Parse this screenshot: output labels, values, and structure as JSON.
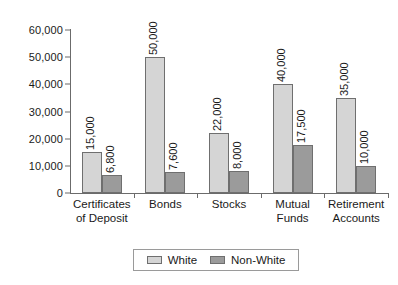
{
  "chart_data": {
    "type": "bar",
    "title": "",
    "xlabel": "",
    "ylabel": "",
    "ylim": [
      0,
      60000
    ],
    "grid": false,
    "legend_position": "bottom",
    "categories": [
      "Certificates of Deposit",
      "Bonds",
      "Stocks",
      "Mutual Funds",
      "Retirement Accounts"
    ],
    "category_lines": [
      [
        "Certificates",
        "of Deposit"
      ],
      [
        "Bonds",
        ""
      ],
      [
        "Stocks",
        ""
      ],
      [
        "Mutual",
        "Funds"
      ],
      [
        "Retirement",
        "Accounts"
      ]
    ],
    "series": [
      {
        "name": "White",
        "color": "#d5d5d5",
        "values": [
          15000,
          50000,
          22000,
          40000,
          35000
        ],
        "labels": [
          "15,000",
          "50,000",
          "22,000",
          "40,000",
          "35,000"
        ]
      },
      {
        "name": "Non-White",
        "color": "#9b9b9b",
        "values": [
          6800,
          7600,
          8000,
          17500,
          10000
        ],
        "labels": [
          "6,800",
          "7,600",
          "8,000",
          "17,500",
          "10,000"
        ]
      }
    ],
    "yticks": [
      0,
      10000,
      20000,
      30000,
      40000,
      50000,
      60000
    ],
    "ytick_labels": [
      "0",
      "10,000",
      "20,000",
      "30,000",
      "40,000",
      "50,000",
      "60,000"
    ]
  },
  "legend": {
    "items": [
      {
        "label": "White",
        "color": "#d5d5d5"
      },
      {
        "label": "Non-White",
        "color": "#9b9b9b"
      }
    ]
  }
}
